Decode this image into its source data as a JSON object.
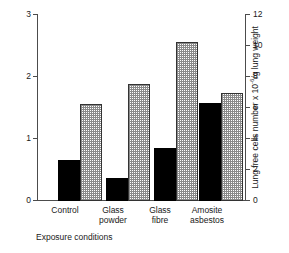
{
  "chart_data": {
    "type": "bar",
    "title": "",
    "subtitle": "",
    "xlabel": "Exposure conditions",
    "ylabel": "Pulmonary surfactant mg/g lung weight",
    "ylabel_right_pre": "Lung free cells number x 10",
    "ylabel_right_sup": "-6",
    "ylabel_right_post": "/g lung weight",
    "ylabel_right_plain": "Lung free cells number x 10-6/g lung weight",
    "categories": [
      "Control",
      "Glass powder",
      "Glass fibre",
      "Amosite asbestos"
    ],
    "category_lines": [
      [
        "Control"
      ],
      [
        "Glass",
        "powder"
      ],
      [
        "Glass",
        "fibre"
      ],
      [
        "Amosite",
        "asbestos"
      ]
    ],
    "series": [
      {
        "name": "Pulmonary surfactant",
        "axis": "left",
        "fill": "solid-black",
        "color": "#000000",
        "values": [
          0.65,
          0.37,
          0.85,
          1.58
        ]
      },
      {
        "name": "Lung free cells number",
        "axis": "right",
        "fill": "checkered-hatch",
        "color": "#8a8a8a",
        "values": [
          6.2,
          7.5,
          10.2,
          6.9
        ]
      }
    ],
    "ylim": [
      0,
      3
    ],
    "yticks": [
      0,
      1,
      2,
      3
    ],
    "yticklabels": [
      "0",
      "1",
      "2",
      "3"
    ],
    "ylim_right": [
      0,
      12
    ],
    "yticks_right": [
      0,
      2,
      4,
      6,
      8,
      10,
      12
    ],
    "yticklabels_right": [
      "0",
      "2",
      "4",
      "6",
      "8",
      "10",
      "12"
    ],
    "grid": false,
    "legend": "none",
    "axis_color": "#4c4c4c",
    "background": "#ffffff"
  }
}
